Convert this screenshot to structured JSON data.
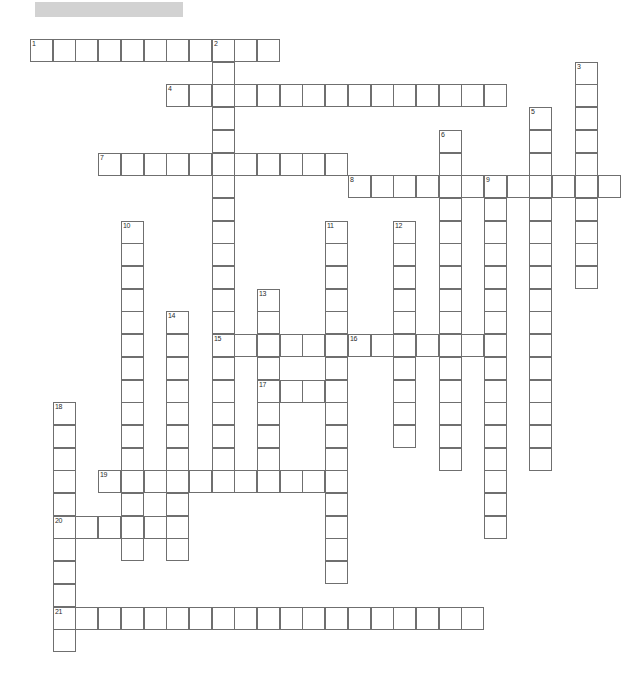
{
  "page": {
    "kind": "crossword-puzzle",
    "width": 627,
    "height": 696,
    "background_color": "#ffffff"
  },
  "title_bar": {
    "text": "",
    "color": "#d2d2d2",
    "x": 35,
    "y": 2,
    "width": 148,
    "height": 15
  },
  "grid": {
    "cell_size": 23,
    "pitch": 22.7,
    "origin_x": 30,
    "origin_y": 39,
    "line_color": "#6f6f6f",
    "cell_fill": "#ffffff",
    "number_color": "#2a2a2a"
  },
  "entries": [
    {
      "number": "1",
      "direction": "across",
      "col": 0,
      "row": 0,
      "length": 11
    },
    {
      "number": "2",
      "direction": "down",
      "col": 8,
      "row": 0,
      "length": 20
    },
    {
      "number": "3",
      "direction": "down",
      "col": 24,
      "row": 1,
      "length": 10
    },
    {
      "number": "4",
      "direction": "across",
      "col": 6,
      "row": 2,
      "length": 15
    },
    {
      "number": "5",
      "direction": "down",
      "col": 22,
      "row": 3,
      "length": 16
    },
    {
      "number": "6",
      "direction": "down",
      "col": 18,
      "row": 4,
      "length": 15
    },
    {
      "number": "7",
      "direction": "across",
      "col": 3,
      "row": 5,
      "length": 11
    },
    {
      "number": "8",
      "direction": "across",
      "col": 14,
      "row": 6,
      "length": 12
    },
    {
      "number": "9",
      "direction": "down",
      "col": 20,
      "row": 6,
      "length": 16
    },
    {
      "number": "10",
      "direction": "down",
      "col": 4,
      "row": 8,
      "length": 15
    },
    {
      "number": "11",
      "direction": "down",
      "col": 13,
      "row": 8,
      "length": 16
    },
    {
      "number": "12",
      "direction": "down",
      "col": 16,
      "row": 8,
      "length": 10
    },
    {
      "number": "13",
      "direction": "down",
      "col": 10,
      "row": 11,
      "length": 9
    },
    {
      "number": "14",
      "direction": "down",
      "col": 6,
      "row": 12,
      "length": 11
    },
    {
      "number": "15",
      "direction": "across",
      "col": 8,
      "row": 13,
      "length": 12
    },
    {
      "number": "16",
      "direction": "across",
      "col": 14,
      "row": 13,
      "length": 6
    },
    {
      "number": "17",
      "direction": "across",
      "col": 10,
      "row": 15,
      "length": 3
    },
    {
      "number": "18",
      "direction": "down",
      "col": 1,
      "row": 16,
      "length": 11
    },
    {
      "number": "19",
      "direction": "across",
      "col": 3,
      "row": 19,
      "length": 10
    },
    {
      "number": "20",
      "direction": "across",
      "col": 1,
      "row": 21,
      "length": 6
    },
    {
      "number": "21",
      "direction": "across",
      "col": 1,
      "row": 25,
      "length": 19
    }
  ],
  "numbered_labels": [
    "1",
    "2",
    "3",
    "4",
    "5",
    "6",
    "7",
    "8",
    "9",
    "10",
    "11",
    "12",
    "13",
    "14",
    "15",
    "16",
    "17",
    "18",
    "19",
    "20",
    "21"
  ]
}
